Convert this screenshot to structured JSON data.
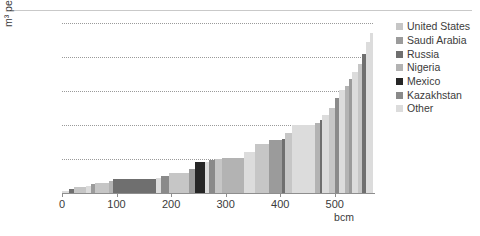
{
  "chart_data": {
    "type": "bar",
    "title": "",
    "subtitle": "",
    "xlabel": "bcm",
    "ylabel": "m³ per barrel",
    "xlim": [
      0,
      570
    ],
    "ylim": [
      0,
      250
    ],
    "grid": true,
    "legend_position": "right",
    "y_ticks": [
      250,
      200,
      150,
      100,
      50
    ],
    "x_ticks": [
      0,
      100,
      200,
      300,
      400,
      500
    ],
    "series": [
      {
        "name": "United States",
        "color": "#c6c6c6"
      },
      {
        "name": "Saudi Arabia",
        "color": "#9b9b9b"
      },
      {
        "name": "Russia",
        "color": "#6f6f6f"
      },
      {
        "name": "Nigeria",
        "color": "#b3b3b3"
      },
      {
        "name": "Mexico",
        "color": "#262626"
      },
      {
        "name": "Kazakhstan",
        "color": "#8a8a8a"
      },
      {
        "name": "Other",
        "color": "#dcdcdc"
      }
    ],
    "bars": [
      {
        "country": "Other",
        "x0": 0,
        "width": 12,
        "value": 3
      },
      {
        "country": "Russia",
        "x0": 12,
        "width": 10,
        "value": 6
      },
      {
        "country": "United States",
        "x0": 22,
        "width": 22,
        "value": 9
      },
      {
        "country": "Other",
        "x0": 44,
        "width": 10,
        "value": 10
      },
      {
        "country": "Saudi Arabia",
        "x0": 54,
        "width": 6,
        "value": 13
      },
      {
        "country": "United States",
        "x0": 60,
        "width": 26,
        "value": 15
      },
      {
        "country": "Nigeria",
        "x0": 86,
        "width": 8,
        "value": 17
      },
      {
        "country": "Russia",
        "x0": 94,
        "width": 78,
        "value": 20
      },
      {
        "country": "Other",
        "x0": 172,
        "width": 10,
        "value": 22
      },
      {
        "country": "Kazakhstan",
        "x0": 182,
        "width": 14,
        "value": 25
      },
      {
        "country": "United States",
        "x0": 196,
        "width": 36,
        "value": 30
      },
      {
        "country": "Saudi Arabia",
        "x0": 232,
        "width": 12,
        "value": 35
      },
      {
        "country": "Mexico",
        "x0": 244,
        "width": 18,
        "value": 45
      },
      {
        "country": "Other",
        "x0": 262,
        "width": 8,
        "value": 46
      },
      {
        "country": "Kazakhstan",
        "x0": 270,
        "width": 10,
        "value": 48
      },
      {
        "country": "United States",
        "x0": 280,
        "width": 14,
        "value": 50
      },
      {
        "country": "Nigeria",
        "x0": 294,
        "width": 40,
        "value": 52
      },
      {
        "country": "Other",
        "x0": 334,
        "width": 20,
        "value": 60
      },
      {
        "country": "United States",
        "x0": 354,
        "width": 26,
        "value": 72
      },
      {
        "country": "Saudi Arabia",
        "x0": 380,
        "width": 24,
        "value": 78
      },
      {
        "country": "Russia",
        "x0": 404,
        "width": 4,
        "value": 80
      },
      {
        "country": "United States",
        "x0": 408,
        "width": 14,
        "value": 88
      },
      {
        "country": "Other",
        "x0": 422,
        "width": 42,
        "value": 100
      },
      {
        "country": "Nigeria",
        "x0": 464,
        "width": 8,
        "value": 103
      },
      {
        "country": "Russia",
        "x0": 472,
        "width": 4,
        "value": 108
      },
      {
        "country": "Other",
        "x0": 476,
        "width": 14,
        "value": 115
      },
      {
        "country": "United States",
        "x0": 490,
        "width": 10,
        "value": 125
      },
      {
        "country": "Kazakhstan",
        "x0": 500,
        "width": 8,
        "value": 140
      },
      {
        "country": "Other",
        "x0": 508,
        "width": 10,
        "value": 152
      },
      {
        "country": "Nigeria",
        "x0": 518,
        "width": 8,
        "value": 158
      },
      {
        "country": "Saudi Arabia",
        "x0": 526,
        "width": 6,
        "value": 168
      },
      {
        "country": "Other",
        "x0": 532,
        "width": 10,
        "value": 178
      },
      {
        "country": "United States",
        "x0": 542,
        "width": 8,
        "value": 190
      },
      {
        "country": "Russia",
        "x0": 550,
        "width": 8,
        "value": 205
      },
      {
        "country": "Other",
        "x0": 558,
        "width": 6,
        "value": 222
      },
      {
        "country": "Other",
        "x0": 564,
        "width": 6,
        "value": 235
      }
    ]
  },
  "legend": {
    "items": [
      {
        "label": "United States"
      },
      {
        "label": "Saudi Arabia"
      },
      {
        "label": "Russia"
      },
      {
        "label": "Nigeria"
      },
      {
        "label": "Mexico"
      },
      {
        "label": "Kazakhstan"
      },
      {
        "label": "Other"
      }
    ]
  }
}
